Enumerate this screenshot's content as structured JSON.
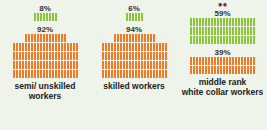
{
  "chart_data": {
    "type": "pictogram",
    "title": "",
    "groups": [
      {
        "label": "semi/ unskilled workers",
        "series": [
          {
            "name": "green",
            "value": 8,
            "label": "8%"
          },
          {
            "name": "orange",
            "value": 92,
            "label": "92%"
          }
        ]
      },
      {
        "label": "skilled workers",
        "series": [
          {
            "name": "green",
            "value": 6,
            "label": "6%"
          },
          {
            "name": "orange",
            "value": 94,
            "label": "94%"
          }
        ]
      },
      {
        "label": "middle rank white collar workers",
        "series": [
          {
            "name": "green",
            "value": 59,
            "label": "59%"
          },
          {
            "name": "orange",
            "value": 39,
            "label": "39%"
          }
        ]
      }
    ],
    "colors": {
      "green": "#8cc43c",
      "orange": "#ee7a2a",
      "icon": "#7a2a55"
    }
  },
  "cols": [
    {
      "top_pct": "8%",
      "bottom_pct": "92%",
      "label1": "semi/ unskilled",
      "label2": "workers"
    },
    {
      "top_pct": "6%",
      "bottom_pct": "94%",
      "label1": "skilled workers",
      "label2": ""
    },
    {
      "top_pct": "59%",
      "bottom_pct": "39%",
      "label1": "middle rank",
      "label2": "white collar workers",
      "icon": "people-icon"
    }
  ]
}
